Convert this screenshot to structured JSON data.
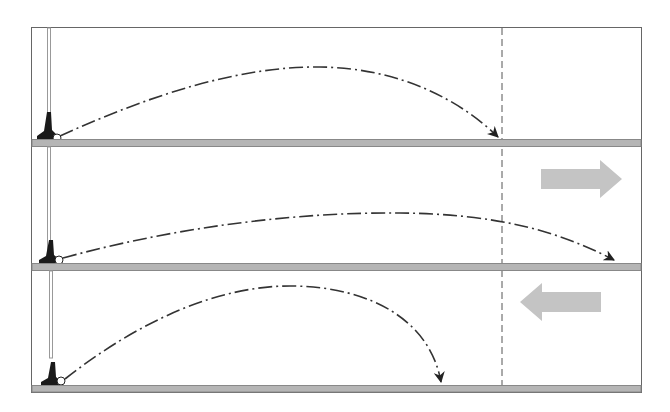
{
  "diagram": {
    "title": "",
    "colors": {
      "frame": "#555555",
      "ground": "#b5b5b5",
      "ground_edge": "#888888",
      "trajectory": "#333333",
      "arrow": "#c4c4c4",
      "club": "#1a1a1a",
      "shaft": "#999999",
      "reference_line": "#555555"
    },
    "reference_line_x": 502,
    "panels": [
      {
        "name": "no-wind",
        "wind": "none",
        "ground_y": 139,
        "ball": {
          "x": 57,
          "y": 138
        },
        "trajectory_end_x": 498,
        "peak": {
          "x": 320,
          "y": 67
        }
      },
      {
        "name": "tailwind",
        "wind": "right",
        "ground_y": 263,
        "ball": {
          "x": 59,
          "y": 260
        },
        "trajectory_end_x": 614,
        "peak": {
          "x": 400,
          "y": 213
        },
        "wind_arrow": {
          "direction": "right",
          "x": 541,
          "y": 160
        }
      },
      {
        "name": "headwind",
        "wind": "left",
        "ground_y": 385,
        "ball": {
          "x": 61,
          "y": 381
        },
        "trajectory_end_x": 441,
        "peak": {
          "x": 293,
          "y": 286
        },
        "wind_arrow": {
          "direction": "left",
          "x": 520,
          "y": 283
        }
      }
    ]
  }
}
